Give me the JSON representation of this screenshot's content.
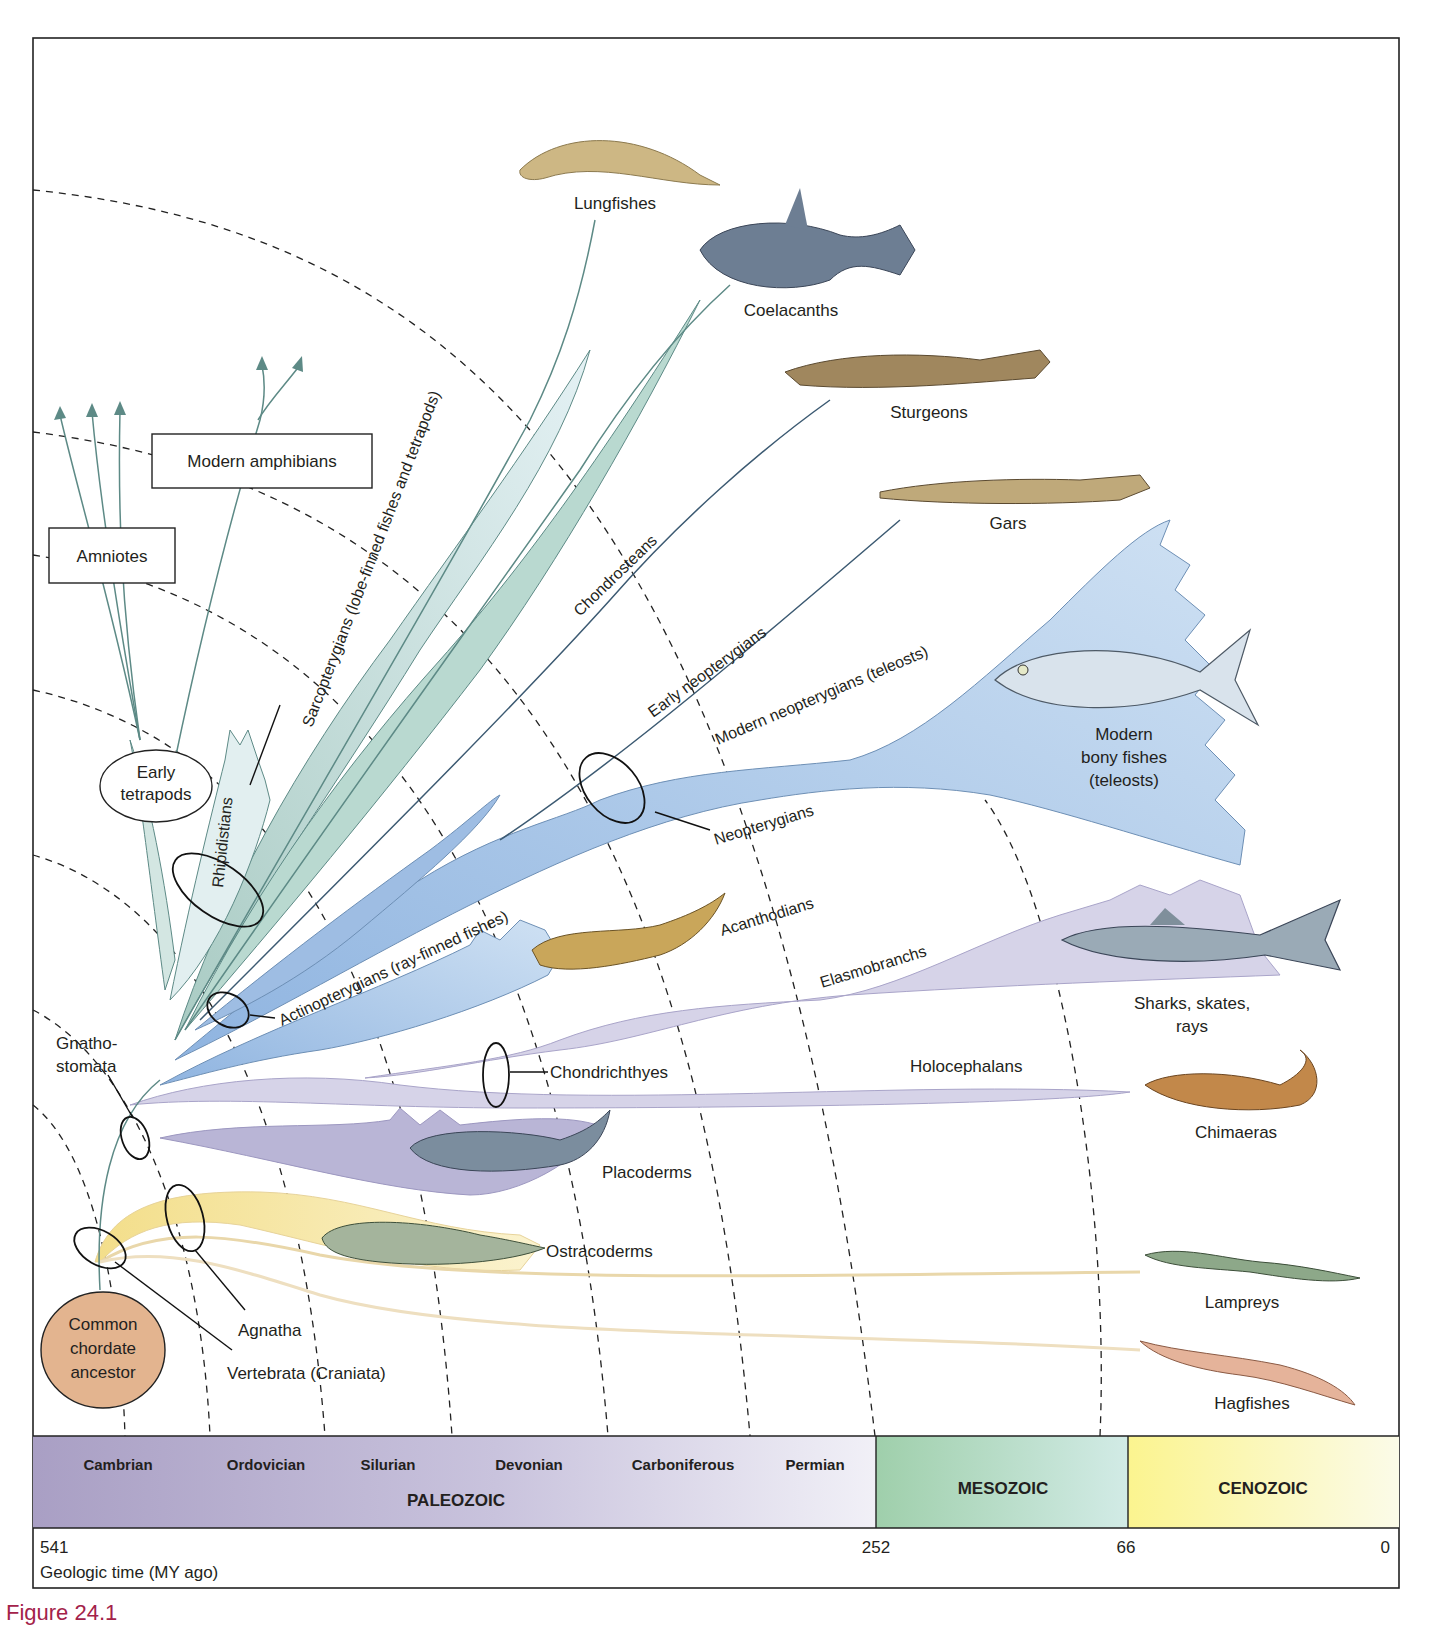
{
  "figure": {
    "caption": "Figure 24.1",
    "colors": {
      "sarcopterygian_fill": "#d3e6e2",
      "sarcopterygian_dark": "#a9cbc3",
      "actinopterygian_fill": "#a8c7e8",
      "actinopterygian_light": "#cfe1f3",
      "chondrichthyan_fill": "#d6d3e8",
      "placoderm_fill": "#b9b5d6",
      "agnathan_fill": "#f5e6a8",
      "ancestor_fill": "#e3b48f",
      "paleozoic_band": "#b8b0cf",
      "mesozoic_band": "#a9d3b3",
      "cenozoic_band": "#fbf6a6",
      "caption_color": "#a3224a"
    }
  },
  "taxa": {
    "lungfishes": "Lungfishes",
    "coelacanths": "Coelacanths",
    "sturgeons": "Sturgeons",
    "gars": "Gars",
    "modern_bony_fishes_1": "Modern",
    "modern_bony_fishes_2": "bony fishes",
    "modern_bony_fishes_3": "(teleosts)",
    "sharks_1": "Sharks, skates,",
    "sharks_2": "rays",
    "chimaeras": "Chimaeras",
    "placoderms": "Placoderms",
    "ostracoderms": "Ostracoderms",
    "lampreys": "Lampreys",
    "hagfishes": "Hagfishes",
    "modern_amphibians": "Modern amphibians",
    "amniotes": "Amniotes",
    "early_tetrapods_1": "Early",
    "early_tetrapods_2": "tetrapods",
    "ancestor_1": "Common",
    "ancestor_2": "chordate",
    "ancestor_3": "ancestor"
  },
  "clades": {
    "sarcopterygians": "Sarcopterygians (lobe-finned fishes and tetrapods)",
    "rhipidistians": "Rhipidistians",
    "chondrosteans": "Chondrosteans",
    "early_neopterygians": "Early neopterygians",
    "modern_neopterygians": "Modern neopterygians (teleosts)",
    "neopterygians": "Neopterygians",
    "actinopterygians": "Actinopterygians (ray-finned fishes)",
    "acanthodians": "Acanthodians",
    "elasmobranchs": "Elasmobranchs",
    "chondrichthyes": "Chondrichthyes",
    "holocephalans": "Holocephalans",
    "gnathostomata_1": "Gnatho-",
    "gnathostomata_2": "stomata",
    "agnatha": "Agnatha",
    "vertebrata": "Vertebrata (Craniata)"
  },
  "timeline": {
    "periods": [
      "Cambrian",
      "Ordovician",
      "Silurian",
      "Devonian",
      "Carboniferous",
      "Permian"
    ],
    "eras": [
      "PALEOZOIC",
      "MESOZOIC",
      "CENOZOIC"
    ],
    "ticks": [
      "541",
      "252",
      "66",
      "0"
    ],
    "axis_label": "Geologic time (MY ago)"
  }
}
